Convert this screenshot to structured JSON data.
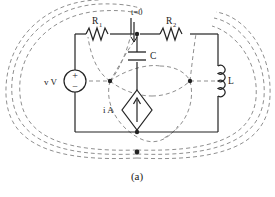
{
  "figure": {
    "caption": "(a)",
    "type": "circuit-diagram",
    "stroke_solid": "#222222",
    "stroke_dashed": "#8a8a8a",
    "background": "#ffffff"
  },
  "labels": {
    "r1": "R",
    "r1_sub": "1",
    "r2": "R",
    "r2_sub": "2",
    "capacitor": "C",
    "inductor": "L",
    "switch": "t=0",
    "voltage_source": "v V",
    "current_source": "i A",
    "plus": "+",
    "minus": "−"
  },
  "components": [
    {
      "name": "voltage-source",
      "label": "v V",
      "kind": "independent-voltage-source"
    },
    {
      "name": "resistor-r1",
      "label": "R1",
      "kind": "resistor"
    },
    {
      "name": "switch",
      "label": "t=0",
      "kind": "switch"
    },
    {
      "name": "capacitor-c",
      "label": "C",
      "kind": "capacitor"
    },
    {
      "name": "resistor-r2",
      "label": "R2",
      "kind": "resistor"
    },
    {
      "name": "inductor-l",
      "label": "L",
      "kind": "inductor"
    },
    {
      "name": "current-source",
      "label": "i A",
      "kind": "independent-current-source"
    }
  ]
}
